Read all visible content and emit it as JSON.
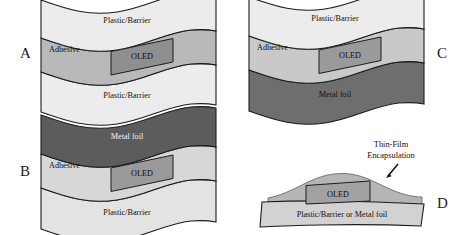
{
  "figure": {
    "panels": [
      {
        "id": "A",
        "letter": "A",
        "layers": [
          {
            "name": "top-plastic-barrier",
            "label": "Plastic/Barrier",
            "color": "#ececec"
          },
          {
            "name": "adhesive",
            "label": "Adhesive",
            "color": "#b9b9b9"
          },
          {
            "name": "bottom-plastic-barrier",
            "label": "Plastic/Barrier",
            "color": "#ececec"
          }
        ],
        "device": {
          "label": "OLED",
          "color": "#8f8f8f"
        }
      },
      {
        "id": "B",
        "letter": "B",
        "layers": [
          {
            "name": "metal-foil",
            "label": "Metal foil",
            "color": "#5c5c5c"
          },
          {
            "name": "adhesive",
            "label": "Adhesive",
            "color": "#d7d7d7"
          },
          {
            "name": "plastic-barrier",
            "label": "Plastic/Barrier",
            "color": "#e3e3e3"
          }
        ],
        "device": {
          "label": "OLED",
          "color": "#9a9a9a"
        }
      },
      {
        "id": "C",
        "letter": "C",
        "layers": [
          {
            "name": "plastic-barrier",
            "label": "Plastic/Barrier",
            "color": "#ececec"
          },
          {
            "name": "adhesive",
            "label": "Adhesive",
            "color": "#c9c9c9"
          },
          {
            "name": "metal-foil",
            "label": "Metal foil",
            "color": "#6e6e6e"
          }
        ],
        "device": {
          "label": "OLED",
          "color": "#9a9a9a"
        }
      },
      {
        "id": "D",
        "letter": "D",
        "layers": [
          {
            "name": "thin-film-encapsulation",
            "label": "",
            "color": "#b5b5b5"
          },
          {
            "name": "substrate",
            "label": "Plastic/Barrier or Metal foil",
            "color": "#d2d2d2"
          }
        ],
        "device": {
          "label": "OLED",
          "color": "#a2a2a2"
        },
        "callout": {
          "line1": "Thin-Film",
          "line2": "Encapsulation",
          "arrow": "arrow-down-left-icon"
        }
      }
    ],
    "colors": {
      "outline": "#1c1c1c",
      "background": "#ffffff",
      "text": "#101010",
      "text_light": "#f2f2f2"
    }
  }
}
